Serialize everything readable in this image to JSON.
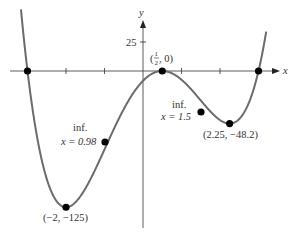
{
  "chart_data": {
    "type": "line",
    "title": "",
    "function": "y = (2x - 1)^2 (x^2 - 9)",
    "xlabel": "x",
    "ylabel": "y",
    "xlim": [
      -3.6,
      3.8
    ],
    "ylim": [
      -135,
      60
    ],
    "y_tick_labels": [
      {
        "value": 25,
        "label": "25"
      }
    ],
    "x_ticks": [
      -3,
      -2,
      -1,
      0,
      1,
      2,
      3
    ],
    "grid": false,
    "points": [
      {
        "x": -3,
        "y": 0,
        "label": ""
      },
      {
        "x": 0.5,
        "y": 0,
        "label": "(1/2, 0)"
      },
      {
        "x": 3,
        "y": 0,
        "label": ""
      },
      {
        "x": -2,
        "y": -125,
        "label": "(−2, −125)"
      },
      {
        "x": 2.25,
        "y": -48.2,
        "label": "(2.25, −48.2)"
      },
      {
        "x": -0.98,
        "y": -86,
        "label": "inf. x = 0.98"
      },
      {
        "x": 1.5,
        "y": -27,
        "label": "inf. x = 1.5"
      }
    ],
    "annotations": {
      "y_axis_label": "y",
      "x_axis_label": "x",
      "tick_25": "25",
      "top_label_open": "(",
      "top_label_num": "1",
      "top_label_den": "2",
      "top_label_close": ", 0)",
      "inf1_line1": "inf.",
      "inf1_line2": "x = 0.98",
      "inf2_line1": "inf.",
      "inf2_line2": "x = 1.5",
      "min_label": "(−2, −125)",
      "local_min_label": "(2.25, −48.2)"
    },
    "colors": {
      "curve": "#6b6b6b",
      "axis": "#333333",
      "point": "#000000"
    }
  }
}
